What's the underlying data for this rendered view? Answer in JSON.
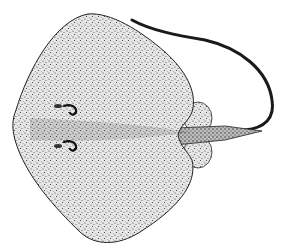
{
  "image": {
    "subject": "stingray illustration, dorsal view",
    "style": "black ink stipple drawing on white",
    "colors": {
      "background": "#ffffff",
      "ink": "#1a1a1a",
      "body_fill": "#d9d9d9"
    }
  }
}
